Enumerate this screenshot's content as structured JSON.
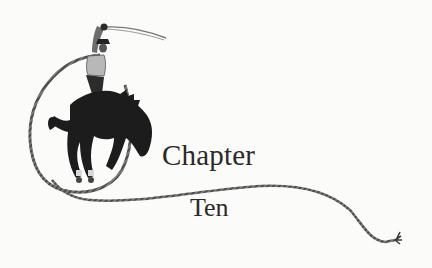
{
  "heading": {
    "label": "Chapter",
    "number": "Ten"
  },
  "illustration": {
    "subject": "cowboy-on-bucking-bronco-with-lasso",
    "colors": {
      "ink": "#1c1c1c",
      "rope": "#6a6a6a",
      "background": "#fbfbfa"
    }
  }
}
